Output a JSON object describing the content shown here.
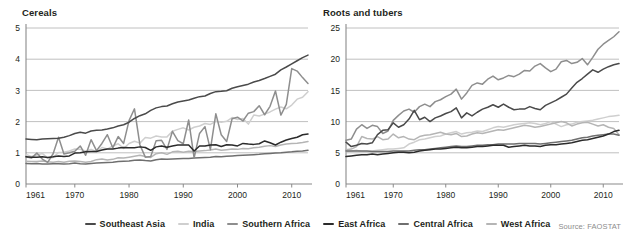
{
  "source_note": "Source: FAOSTAT",
  "series_meta": [
    {
      "name": "Southeast Asia",
      "color": "#4a4a4a"
    },
    {
      "name": "India",
      "color": "#cfcfcf"
    },
    {
      "name": "Southern Africa",
      "color": "#8e8e8e"
    },
    {
      "name": "East Africa",
      "color": "#2b2b2b"
    },
    {
      "name": "Central Africa",
      "color": "#6f6f6f"
    },
    {
      "name": "West Africa",
      "color": "#b5b5b5"
    }
  ],
  "legend": {
    "items": [
      {
        "label": "Southeast Asia"
      },
      {
        "label": "India"
      },
      {
        "label": "Southern Africa"
      },
      {
        "label": "East Africa"
      },
      {
        "label": "Central Africa"
      },
      {
        "label": "West Africa"
      }
    ]
  },
  "panels": [
    {
      "title": "Cereals"
    },
    {
      "title": "Roots and tubers"
    }
  ],
  "chart_data": [
    {
      "type": "line",
      "title": "Cereals",
      "xlabel": "",
      "ylabel": "",
      "grid": true,
      "legend_position": "bottom",
      "xlim": [
        1961,
        2013
      ],
      "ylim": [
        0,
        5
      ],
      "yticks": [
        0,
        1,
        2,
        3,
        4,
        5
      ],
      "xticks": [
        1961,
        1970,
        1980,
        1990,
        2000,
        2010
      ],
      "x": [
        1961,
        1962,
        1963,
        1964,
        1965,
        1966,
        1967,
        1968,
        1969,
        1970,
        1971,
        1972,
        1973,
        1974,
        1975,
        1976,
        1977,
        1978,
        1979,
        1980,
        1981,
        1982,
        1983,
        1984,
        1985,
        1986,
        1987,
        1988,
        1989,
        1990,
        1991,
        1992,
        1993,
        1994,
        1995,
        1996,
        1997,
        1998,
        1999,
        2000,
        2001,
        2002,
        2003,
        2004,
        2005,
        2006,
        2007,
        2008,
        2009,
        2010,
        2011,
        2012,
        2013
      ],
      "series": [
        {
          "name": "Southeast Asia",
          "color": "#4a4a4a",
          "values": [
            1.44,
            1.43,
            1.42,
            1.44,
            1.45,
            1.46,
            1.47,
            1.5,
            1.55,
            1.62,
            1.66,
            1.63,
            1.7,
            1.72,
            1.73,
            1.76,
            1.8,
            1.86,
            1.9,
            1.98,
            2.1,
            2.19,
            2.25,
            2.36,
            2.44,
            2.48,
            2.5,
            2.57,
            2.63,
            2.66,
            2.69,
            2.75,
            2.8,
            2.82,
            2.9,
            2.96,
            2.97,
            2.99,
            3.07,
            3.12,
            3.16,
            3.2,
            3.27,
            3.32,
            3.38,
            3.45,
            3.52,
            3.66,
            3.75,
            3.85,
            3.95,
            4.05,
            4.13
          ]
        },
        {
          "name": "India",
          "color": "#cfcfcf",
          "values": [
            0.95,
            0.88,
            0.93,
            0.98,
            0.83,
            0.85,
            1.01,
            1.02,
            1.06,
            1.12,
            1.11,
            1.06,
            1.11,
            1.04,
            1.17,
            1.12,
            1.22,
            1.29,
            1.14,
            1.3,
            1.37,
            1.31,
            1.49,
            1.47,
            1.54,
            1.51,
            1.51,
            1.69,
            1.75,
            1.8,
            1.73,
            1.82,
            1.86,
            1.94,
            1.91,
            2.01,
            1.98,
            2.01,
            2.13,
            2.07,
            2.1,
            1.92,
            2.21,
            2.18,
            2.24,
            2.31,
            2.4,
            2.47,
            2.41,
            2.53,
            2.72,
            2.78,
            2.96
          ]
        },
        {
          "name": "Southern Africa",
          "color": "#8e8e8e",
          "values": [
            0.87,
            0.83,
            0.99,
            0.8,
            0.69,
            0.97,
            1.5,
            0.96,
            1.0,
            1.05,
            1.22,
            0.92,
            1.42,
            1.07,
            1.3,
            1.58,
            1.16,
            1.52,
            1.3,
            2.03,
            2.41,
            1.26,
            0.86,
            0.88,
            1.39,
            1.4,
            1.11,
            1.69,
            1.39,
            1.29,
            2.05,
            0.84,
            1.62,
            1.84,
            1.1,
            2.25,
            1.58,
            1.36,
            2.09,
            2.14,
            2.02,
            2.27,
            2.32,
            2.51,
            2.22,
            2.49,
            2.98,
            2.21,
            2.55,
            3.7,
            3.62,
            3.41,
            3.22
          ]
        },
        {
          "name": "East Africa",
          "color": "#2b2b2b",
          "values": [
            0.87,
            0.86,
            0.86,
            0.87,
            0.85,
            0.87,
            0.9,
            0.88,
            0.9,
            0.99,
            1.0,
            1.03,
            1.04,
            1.04,
            1.09,
            1.12,
            1.12,
            1.15,
            1.17,
            1.16,
            1.16,
            1.19,
            1.17,
            1.08,
            1.19,
            1.22,
            1.18,
            1.22,
            1.25,
            1.25,
            1.25,
            1.06,
            1.22,
            1.22,
            1.25,
            1.26,
            1.2,
            1.26,
            1.25,
            1.22,
            1.3,
            1.28,
            1.27,
            1.29,
            1.38,
            1.32,
            1.25,
            1.34,
            1.41,
            1.46,
            1.5,
            1.58,
            1.6
          ]
        },
        {
          "name": "Central Africa",
          "color": "#6f6f6f",
          "values": [
            0.66,
            0.65,
            0.66,
            0.64,
            0.64,
            0.65,
            0.65,
            0.64,
            0.65,
            0.67,
            0.65,
            0.64,
            0.66,
            0.67,
            0.68,
            0.69,
            0.7,
            0.72,
            0.73,
            0.74,
            0.76,
            0.77,
            0.75,
            0.74,
            0.78,
            0.8,
            0.79,
            0.8,
            0.81,
            0.82,
            0.82,
            0.83,
            0.84,
            0.85,
            0.86,
            0.88,
            0.87,
            0.89,
            0.9,
            0.91,
            0.92,
            0.93,
            0.94,
            0.95,
            0.97,
            0.98,
            0.99,
            1.0,
            1.02,
            1.03,
            1.05,
            1.06,
            1.08
          ]
        },
        {
          "name": "West Africa",
          "color": "#b5b5b5",
          "values": [
            0.73,
            0.72,
            0.72,
            0.74,
            0.71,
            0.7,
            0.72,
            0.7,
            0.73,
            0.74,
            0.72,
            0.7,
            0.72,
            0.78,
            0.8,
            0.77,
            0.79,
            0.84,
            0.83,
            0.86,
            0.89,
            0.92,
            0.88,
            0.85,
            0.97,
            1.0,
            0.95,
            1.03,
            1.05,
            1.02,
            1.05,
            1.04,
            1.06,
            1.07,
            1.09,
            1.12,
            1.08,
            1.1,
            1.12,
            1.11,
            1.14,
            1.13,
            1.16,
            1.18,
            1.21,
            1.23,
            1.2,
            1.25,
            1.28,
            1.3,
            1.31,
            1.33,
            1.36
          ]
        }
      ]
    },
    {
      "type": "line",
      "title": "Roots and tubers",
      "xlabel": "",
      "ylabel": "",
      "grid": true,
      "legend_position": "bottom",
      "xlim": [
        1961,
        2013
      ],
      "ylim": [
        0,
        25
      ],
      "yticks": [
        0,
        5,
        10,
        15,
        20,
        25
      ],
      "xticks": [
        1961,
        1970,
        1980,
        1990,
        2000,
        2010
      ],
      "x": [
        1961,
        1962,
        1963,
        1964,
        1965,
        1966,
        1967,
        1968,
        1969,
        1970,
        1971,
        1972,
        1973,
        1974,
        1975,
        1976,
        1977,
        1978,
        1979,
        1980,
        1981,
        1982,
        1983,
        1984,
        1985,
        1986,
        1987,
        1988,
        1989,
        1990,
        1991,
        1992,
        1993,
        1994,
        1995,
        1996,
        1997,
        1998,
        1999,
        2000,
        2001,
        2002,
        2003,
        2004,
        2005,
        2006,
        2007,
        2008,
        2009,
        2010,
        2011,
        2012,
        2013
      ],
      "series": [
        {
          "name": "Southeast Asia",
          "color": "#4a4a4a",
          "values": [
            6.7,
            6.0,
            6.2,
            6.5,
            6.4,
            6.6,
            7.9,
            8.6,
            8.7,
            9.8,
            9.1,
            9.5,
            10.4,
            11.8,
            10.3,
            10.7,
            10.0,
            10.6,
            10.9,
            11.3,
            11.6,
            12.2,
            10.6,
            11.4,
            10.9,
            11.5,
            12.0,
            12.3,
            12.7,
            12.3,
            12.8,
            12.3,
            11.9,
            12.0,
            12.0,
            12.4,
            12.1,
            11.9,
            12.6,
            13.0,
            13.4,
            13.9,
            14.4,
            15.4,
            16.3,
            16.9,
            17.6,
            18.3,
            17.9,
            18.4,
            18.8,
            19.1,
            19.3
          ]
        },
        {
          "name": "India",
          "color": "#cfcfcf",
          "values": [
            5.2,
            5.3,
            5.4,
            5.2,
            5.2,
            5.3,
            5.4,
            5.5,
            5.6,
            5.6,
            5.7,
            5.8,
            6.4,
            6.7,
            7.1,
            7.2,
            7.4,
            7.6,
            7.7,
            8.0,
            8.2,
            8.4,
            8.0,
            8.2,
            8.3,
            8.5,
            8.4,
            8.7,
            9.0,
            9.2,
            9.1,
            9.3,
            9.5,
            9.6,
            9.7,
            9.8,
            9.7,
            9.5,
            9.7,
            10.0,
            9.6,
            9.2,
            9.5,
            9.6,
            9.9,
            10.0,
            10.1,
            10.2,
            10.4,
            10.6,
            10.8,
            10.9,
            11.0
          ]
        },
        {
          "name": "Southern Africa",
          "color": "#8e8e8e",
          "values": [
            7.0,
            7.2,
            8.8,
            9.5,
            8.9,
            9.4,
            9.2,
            8.1,
            8.5,
            10.2,
            11.0,
            11.7,
            12.0,
            11.5,
            12.4,
            12.8,
            12.4,
            13.2,
            13.5,
            14.0,
            14.4,
            15.2,
            13.6,
            14.6,
            15.8,
            16.2,
            16.0,
            16.8,
            17.3,
            16.7,
            17.0,
            17.4,
            17.2,
            17.6,
            18.2,
            18.1,
            18.9,
            19.3,
            18.6,
            18.0,
            18.4,
            19.6,
            19.8,
            19.3,
            19.5,
            20.1,
            19.1,
            20.3,
            21.6,
            22.4,
            23.0,
            23.6,
            24.4
          ]
        },
        {
          "name": "East Africa",
          "color": "#2b2b2b",
          "values": [
            4.4,
            4.5,
            4.6,
            4.7,
            4.7,
            4.8,
            4.7,
            4.8,
            4.9,
            5.0,
            5.1,
            5.1,
            5.0,
            5.1,
            5.3,
            5.4,
            5.5,
            5.6,
            5.6,
            5.7,
            5.8,
            5.9,
            5.8,
            5.8,
            5.9,
            6.0,
            6.0,
            6.1,
            6.2,
            6.2,
            6.2,
            5.9,
            6.0,
            6.1,
            6.2,
            6.1,
            6.1,
            6.0,
            6.2,
            6.3,
            6.3,
            6.4,
            6.5,
            6.6,
            6.8,
            7.0,
            7.1,
            7.3,
            7.5,
            7.7,
            8.0,
            8.4,
            8.6
          ]
        },
        {
          "name": "Central Africa",
          "color": "#6f6f6f",
          "values": [
            5.3,
            5.3,
            5.3,
            5.3,
            5.3,
            5.2,
            5.2,
            5.2,
            5.2,
            5.3,
            5.3,
            5.3,
            5.3,
            5.4,
            5.5,
            5.5,
            5.6,
            5.7,
            5.8,
            5.9,
            6.0,
            6.1,
            6.0,
            6.0,
            6.1,
            6.2,
            6.2,
            6.3,
            6.3,
            6.4,
            6.4,
            6.4,
            6.4,
            6.5,
            6.5,
            6.5,
            6.5,
            6.4,
            6.5,
            6.6,
            6.7,
            6.8,
            6.9,
            7.0,
            7.2,
            7.4,
            7.5,
            7.7,
            7.8,
            7.9,
            8.0,
            8.0,
            7.8
          ]
        },
        {
          "name": "West Africa",
          "color": "#b5b5b5",
          "values": [
            5.5,
            5.6,
            6.0,
            7.6,
            7.3,
            7.2,
            7.6,
            7.1,
            7.2,
            8.0,
            7.4,
            7.6,
            7.2,
            7.1,
            7.6,
            7.8,
            7.9,
            8.1,
            8.3,
            8.0,
            7.9,
            8.1,
            7.6,
            7.7,
            8.0,
            8.2,
            8.1,
            8.3,
            8.5,
            8.7,
            8.6,
            8.8,
            9.0,
            9.2,
            9.4,
            9.3,
            9.1,
            9.2,
            9.4,
            9.6,
            9.8,
            10.0,
            9.8,
            9.3,
            9.6,
            9.8,
            9.9,
            9.6,
            9.3,
            9.5,
            9.1,
            8.9,
            7.9
          ]
        }
      ]
    }
  ]
}
